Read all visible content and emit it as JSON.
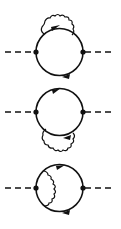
{
  "figure": {
    "diagrams": [
      {
        "label": "vertex-correction-top",
        "wavy_position": "outside-top"
      },
      {
        "label": "vertex-correction-bottom",
        "wavy_position": "outside-bottom"
      },
      {
        "label": "vertex-correction-internal",
        "wavy_position": "inside-left"
      }
    ],
    "colors": {
      "ink": "#111111",
      "background": "#ffffff"
    }
  }
}
